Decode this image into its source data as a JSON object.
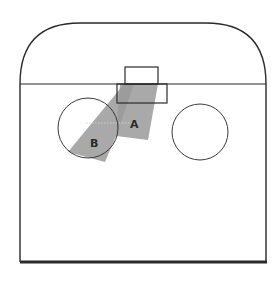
{
  "diagram": {
    "labels": {
      "a": "A",
      "b": "B"
    },
    "colors": {
      "outline": "#2a2a2a",
      "shade": "#9a9a9a",
      "background": "#ffffff"
    }
  }
}
